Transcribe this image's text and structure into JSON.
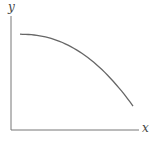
{
  "chart_data": {
    "type": "line",
    "title": "",
    "xlabel": "x",
    "ylabel": "y",
    "grid": false,
    "legend": null,
    "series": [
      {
        "name": "curve",
        "points": [
          [
            0.0,
            0.84
          ],
          [
            0.2,
            0.82
          ],
          [
            0.4,
            0.76
          ],
          [
            0.6,
            0.65
          ],
          [
            0.8,
            0.47
          ],
          [
            1.0,
            0.21
          ]
        ]
      }
    ],
    "xlim": [
      0,
      1.1
    ],
    "ylim": [
      0,
      1
    ]
  },
  "labels": {
    "x": "x",
    "y": "y"
  },
  "colors": {
    "axis": "#777777",
    "curve": "#666666"
  }
}
